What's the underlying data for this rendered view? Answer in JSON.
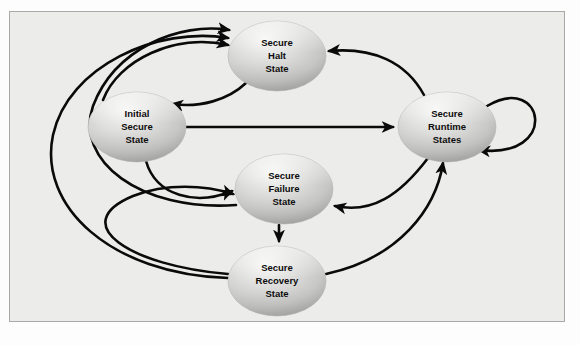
{
  "diagram": {
    "panel": {
      "background_color": "#ececeb",
      "border_color": "#a9a9a7"
    },
    "node_style": {
      "fill_light": "#f2f2f1",
      "fill_mid": "#c9c9c7",
      "fill_dark": "#a8a8a6",
      "text_color": "#0d0d0d"
    },
    "edge_style": {
      "color": "#0a0a0a",
      "width": 2.6
    },
    "nodes": [
      {
        "id": "halt",
        "name": "secure-halt-state",
        "lines": [
          "Secure",
          "Halt",
          "State"
        ],
        "cx": 277,
        "cy": 56,
        "rx": 49,
        "ry": 35
      },
      {
        "id": "initial",
        "name": "initial-secure-state",
        "lines": [
          "Initial",
          "Secure",
          "State"
        ],
        "cx": 137,
        "cy": 127,
        "rx": 49,
        "ry": 35
      },
      {
        "id": "runtime",
        "name": "secure-runtime-states",
        "lines": [
          "Secure",
          "Runtime",
          "States"
        ],
        "cx": 447,
        "cy": 127,
        "rx": 49,
        "ry": 35
      },
      {
        "id": "failure",
        "name": "secure-failure-state",
        "lines": [
          "Secure",
          "Failure",
          "State"
        ],
        "cx": 284,
        "cy": 189,
        "rx": 49,
        "ry": 35
      },
      {
        "id": "recovery",
        "name": "secure-recovery-state",
        "lines": [
          "Secure",
          "Recovery",
          "State"
        ],
        "cx": 277,
        "cy": 281,
        "rx": 49,
        "ry": 35
      }
    ],
    "edges": [
      {
        "id": "e1",
        "name": "edge-initial-to-runtime",
        "from": "initial",
        "to": "runtime",
        "label": "",
        "path": "M 186 127 L 393 127",
        "arrow": true
      },
      {
        "id": "e2",
        "name": "edge-initial-to-halt",
        "from": "initial",
        "to": "halt",
        "label": "",
        "path": "M 103 100 C 118 60 175 33 228 45",
        "arrow": true
      },
      {
        "id": "e3",
        "name": "edge-halt-to-initial",
        "from": "halt",
        "to": "initial",
        "label": "",
        "path": "M 246 83 C 228 100 200 108 172 104",
        "arrow": true
      },
      {
        "id": "e4",
        "name": "edge-initial-to-failure",
        "from": "initial",
        "to": "failure",
        "label": "",
        "path": "M 146 161 C 156 196 196 206 232 191",
        "arrow": true
      },
      {
        "id": "e5",
        "name": "edge-failure-to-recovery",
        "from": "failure",
        "to": "recovery",
        "label": "",
        "path": "M 279 225 L 279 241",
        "arrow": true
      },
      {
        "id": "e6",
        "name": "edge-runtime-to-halt",
        "from": "runtime",
        "to": "halt",
        "label": "",
        "path": "M 424 95 C 406 62 373 47 329 51",
        "arrow": true
      },
      {
        "id": "e7",
        "name": "edge-runtime-to-failure",
        "from": "runtime",
        "to": "failure",
        "label": "",
        "path": "M 428 158 C 400 195 372 214 335 206",
        "arrow": true
      },
      {
        "id": "e8",
        "name": "edge-recovery-to-runtime",
        "from": "recovery",
        "to": "runtime",
        "label": "",
        "path": "M 326 274 C 400 258 436 208 443 163",
        "arrow": true
      },
      {
        "id": "e9",
        "name": "edge-runtime-self-loop",
        "from": "runtime",
        "to": "runtime",
        "label": "",
        "path": "M 487 106 C 545 72 560 160 479 150",
        "arrow": true
      },
      {
        "id": "e10",
        "name": "edge-recovery-to-failure",
        "from": "recovery",
        "to": "failure",
        "label": "",
        "path": "M 228 274 C 130 266 66 224 133 196 C 166 183 205 185 233 194",
        "arrow": true
      },
      {
        "id": "e11",
        "name": "edge-recovery-to-halt",
        "from": "recovery",
        "to": "halt",
        "label": "",
        "path": "M 228 278 C 110 274 38 206 53 135 C 68 66 158 26 228 38",
        "arrow": true
      },
      {
        "id": "e12",
        "name": "edge-failure-to-halt",
        "from": "failure",
        "to": "halt",
        "label": "",
        "path": "M 236 205 C 140 212 74 160 93 106 C 115 48 180 22 229 30",
        "arrow": true
      }
    ]
  }
}
